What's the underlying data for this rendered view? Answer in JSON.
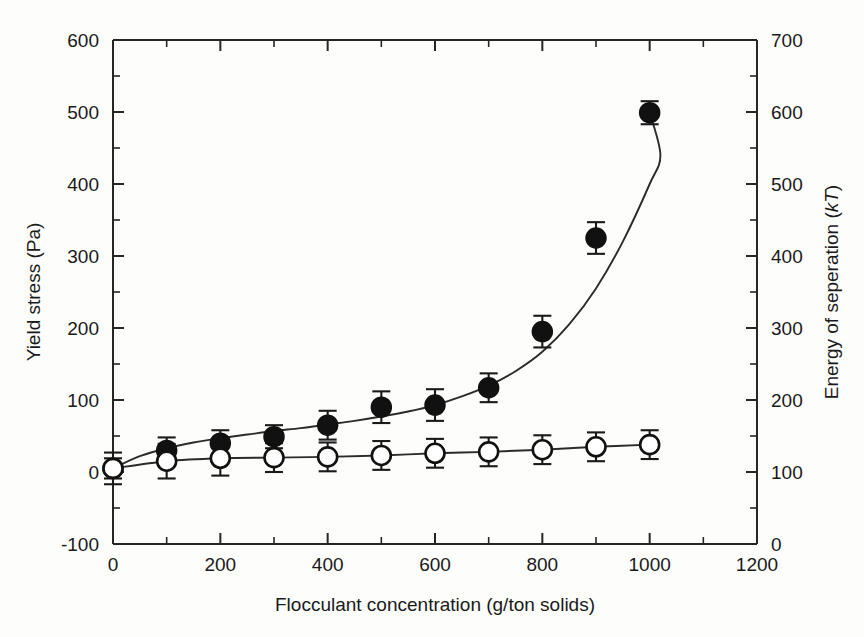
{
  "chart_data": {
    "type": "scatter",
    "title": "",
    "xlabel": "Flocculant concentration (g/ton solids)",
    "ylabel": "Yield stress (Pa)",
    "y2label_prefix": "Energy of seperation (",
    "y2label_italic": "kT",
    "y2label_suffix": ")",
    "xlim": [
      0,
      1200
    ],
    "ylim": [
      -100,
      600
    ],
    "y2lim": [
      0,
      700
    ],
    "grid": false,
    "legend": "none",
    "xticks": [
      0,
      200,
      400,
      600,
      800,
      1000,
      1200
    ],
    "xtick_labels": [
      "0",
      "200",
      "400",
      "600",
      "800",
      "1000",
      "1200"
    ],
    "xminor_step": 100,
    "yticks": [
      -100,
      0,
      100,
      200,
      300,
      400,
      500,
      600
    ],
    "ytick_labels": [
      "-100",
      "0",
      "100",
      "200",
      "300",
      "400",
      "500",
      "600"
    ],
    "y2ticks": [
      0,
      100,
      200,
      300,
      400,
      500,
      600,
      700
    ],
    "y2tick_labels": [
      "0",
      "100",
      "200",
      "300",
      "400",
      "500",
      "600",
      "700"
    ],
    "x": [
      0,
      100,
      200,
      300,
      400,
      500,
      600,
      700,
      800,
      900,
      1000
    ],
    "series": [
      {
        "name": "Yield stress (filled circles)",
        "marker": "filled-circle",
        "axis": "left",
        "values": [
          5,
          30,
          40,
          49,
          65,
          90,
          93,
          117,
          195,
          325,
          499
        ],
        "errors": [
          14,
          18,
          18,
          16,
          20,
          22,
          22,
          20,
          22,
          22,
          16
        ]
      },
      {
        "name": "Energy of seperation (open circles)",
        "marker": "open-circle",
        "axis": "right",
        "values": [
          5,
          15,
          19,
          20,
          21,
          23,
          26,
          28,
          31,
          35,
          38
        ],
        "errors": [
          22,
          24,
          24,
          20,
          20,
          20,
          20,
          20,
          20,
          20,
          20
        ]
      }
    ],
    "fit_curves": [
      {
        "name": "filled-fit",
        "points": [
          [
            0,
            5
          ],
          [
            50,
            22
          ],
          [
            100,
            33
          ],
          [
            150,
            41
          ],
          [
            200,
            47
          ],
          [
            250,
            52
          ],
          [
            300,
            57
          ],
          [
            350,
            61
          ],
          [
            400,
            66
          ],
          [
            450,
            71
          ],
          [
            500,
            77
          ],
          [
            550,
            84
          ],
          [
            600,
            93
          ],
          [
            650,
            105
          ],
          [
            700,
            120
          ],
          [
            750,
            140
          ],
          [
            800,
            167
          ],
          [
            850,
            205
          ],
          [
            900,
            255
          ],
          [
            950,
            320
          ],
          [
            1000,
            400
          ],
          [
            1020,
            440
          ],
          [
            1000,
            499
          ]
        ]
      },
      {
        "name": "open-fit",
        "points": [
          [
            0,
            5
          ],
          [
            100,
            15
          ],
          [
            200,
            19
          ],
          [
            300,
            20
          ],
          [
            400,
            21
          ],
          [
            500,
            23
          ],
          [
            600,
            26
          ],
          [
            700,
            28
          ],
          [
            800,
            31
          ],
          [
            900,
            35
          ],
          [
            1000,
            38
          ]
        ]
      }
    ]
  },
  "colors": {
    "ink": "#1a1a1a",
    "axis": "#262626",
    "marker_filled": "#111111",
    "marker_open_fill": "#ffffff",
    "background": "#fdfdfc"
  }
}
